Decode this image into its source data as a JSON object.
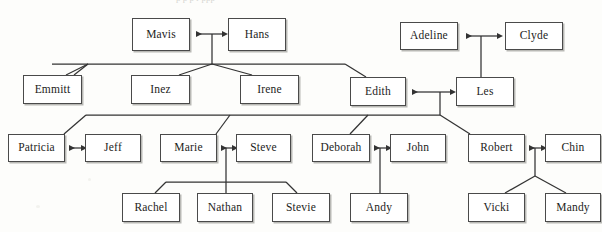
{
  "diagram": {
    "type": "genogram",
    "page_bleed_text": "p                 p    p   r  ppp",
    "colors": {
      "line": "#333333",
      "box_border": "#4a4a4a",
      "box_fill": "#ffffff",
      "box_shadow": "#b9b9b5",
      "text": "#1d1d1b",
      "background": "#fdfdfb"
    },
    "generations": [
      {
        "index": 1,
        "label": "Generation 1",
        "people": [
          "Mavis",
          "Hans",
          "Adeline",
          "Clyde"
        ]
      },
      {
        "index": 2,
        "label": "Generation 2",
        "people": [
          "Emmitt",
          "Inez",
          "Irene",
          "Edith",
          "Les"
        ]
      },
      {
        "index": 3,
        "label": "Generation 3",
        "people": [
          "Patricia",
          "Jeff",
          "Marie",
          "Steve",
          "Deborah",
          "John",
          "Robert",
          "Chin"
        ]
      },
      {
        "index": 4,
        "label": "Generation 4",
        "people": [
          "Rachel",
          "Nathan",
          "Stevie",
          "Andy",
          "Vicki",
          "Mandy"
        ]
      }
    ],
    "nodes": [
      {
        "id": "mavis",
        "label": "Mavis",
        "x": 132,
        "y": 18,
        "w": 58,
        "h": 33,
        "generation": 1
      },
      {
        "id": "hans",
        "label": "Hans",
        "x": 228,
        "y": 18,
        "w": 58,
        "h": 33,
        "generation": 1
      },
      {
        "id": "adeline",
        "label": "Adeline",
        "x": 400,
        "y": 22,
        "w": 58,
        "h": 28,
        "generation": 1
      },
      {
        "id": "clyde",
        "label": "Clyde",
        "x": 505,
        "y": 22,
        "w": 58,
        "h": 28,
        "generation": 1
      },
      {
        "id": "emmitt",
        "label": "Emmitt",
        "x": 23,
        "y": 75,
        "w": 59,
        "h": 29,
        "generation": 2
      },
      {
        "id": "inez",
        "label": "Inez",
        "x": 131,
        "y": 75,
        "w": 59,
        "h": 29,
        "generation": 2
      },
      {
        "id": "irene",
        "label": "Irene",
        "x": 240,
        "y": 75,
        "w": 59,
        "h": 29,
        "generation": 2
      },
      {
        "id": "edith",
        "label": "Edith",
        "x": 350,
        "y": 77,
        "w": 56,
        "h": 29,
        "generation": 2
      },
      {
        "id": "les",
        "label": "Les",
        "x": 456,
        "y": 77,
        "w": 58,
        "h": 29,
        "generation": 2
      },
      {
        "id": "patricia",
        "label": "Patricia",
        "x": 8,
        "y": 134,
        "w": 57,
        "h": 28,
        "generation": 3
      },
      {
        "id": "jeff",
        "label": "Jeff",
        "x": 85,
        "y": 134,
        "w": 56,
        "h": 28,
        "generation": 3
      },
      {
        "id": "marie",
        "label": "Marie",
        "x": 160,
        "y": 134,
        "w": 57,
        "h": 28,
        "generation": 3
      },
      {
        "id": "steve",
        "label": "Steve",
        "x": 236,
        "y": 134,
        "w": 55,
        "h": 28,
        "generation": 3
      },
      {
        "id": "deborah",
        "label": "Deborah",
        "x": 312,
        "y": 134,
        "w": 58,
        "h": 28,
        "generation": 3
      },
      {
        "id": "john",
        "label": "John",
        "x": 390,
        "y": 134,
        "w": 56,
        "h": 28,
        "generation": 3
      },
      {
        "id": "robert",
        "label": "Robert",
        "x": 468,
        "y": 134,
        "w": 57,
        "h": 28,
        "generation": 3
      },
      {
        "id": "chin",
        "label": "Chin",
        "x": 545,
        "y": 134,
        "w": 56,
        "h": 28,
        "generation": 3
      },
      {
        "id": "rachel",
        "label": "Rachel",
        "x": 122,
        "y": 193,
        "w": 58,
        "h": 29,
        "generation": 4
      },
      {
        "id": "nathan",
        "label": "Nathan",
        "x": 197,
        "y": 193,
        "w": 56,
        "h": 29,
        "generation": 4
      },
      {
        "id": "stevie",
        "label": "Stevie",
        "x": 272,
        "y": 193,
        "w": 58,
        "h": 29,
        "generation": 4
      },
      {
        "id": "andy",
        "label": "Andy",
        "x": 350,
        "y": 193,
        "w": 58,
        "h": 29,
        "generation": 4
      },
      {
        "id": "vicki",
        "label": "Vicki",
        "x": 468,
        "y": 193,
        "w": 57,
        "h": 29,
        "generation": 4
      },
      {
        "id": "mandy",
        "label": "Mandy",
        "x": 545,
        "y": 193,
        "w": 56,
        "h": 29,
        "generation": 4
      }
    ],
    "couples": [
      {
        "a": "Mavis",
        "b": "Hans",
        "connector": "double-arrow"
      },
      {
        "a": "Adeline",
        "b": "Clyde",
        "connector": "double-arrow"
      },
      {
        "a": "Edith",
        "b": "Les",
        "connector": "double-arrow"
      },
      {
        "a": "Patricia",
        "b": "Jeff",
        "connector": "double-arrow"
      },
      {
        "a": "Marie",
        "b": "Steve",
        "connector": "double-arrow"
      },
      {
        "a": "Deborah",
        "b": "John",
        "connector": "double-arrow"
      },
      {
        "a": "Robert",
        "b": "Chin",
        "connector": "double-arrow"
      }
    ],
    "parent_child_links": [
      {
        "parents": "Mavis + Hans",
        "children": [
          "Emmitt",
          "Inez",
          "Irene",
          "Edith"
        ]
      },
      {
        "parents": "Adeline + Clyde",
        "children": [
          "Les"
        ]
      },
      {
        "parents": "Edith + Les",
        "children": [
          "Patricia",
          "Marie",
          "Deborah",
          "Robert"
        ]
      },
      {
        "parents": "Marie + Steve",
        "children": [
          "Rachel",
          "Nathan",
          "Stevie"
        ]
      },
      {
        "parents": "Deborah + John",
        "children": [
          "Andy"
        ]
      },
      {
        "parents": "Robert + Chin",
        "children": [
          "Vicki",
          "Mandy"
        ]
      }
    ]
  }
}
